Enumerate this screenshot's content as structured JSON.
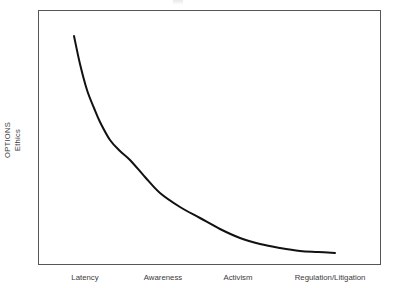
{
  "figure": {
    "background_color": "#ffffff",
    "frame_color": "#565656",
    "curve_color": "#111111",
    "text_color": "#3b3b3b"
  },
  "axes": {
    "y_label_outer": "OPTIONS",
    "y_label_inner": "Ethics",
    "x_labels": [
      {
        "text": "Latency",
        "x_px": 85
      },
      {
        "text": "Awareness",
        "x_px": 163
      },
      {
        "text": "Activism",
        "x_px": 238
      },
      {
        "text": "Regulation/Litigation",
        "x_px": 330
      }
    ]
  },
  "chart_data": {
    "type": "line",
    "title": "",
    "subtitle": "",
    "xlabel": "",
    "ylabel": "OPTIONS / Ethics",
    "ylabel_parts": [
      "OPTIONS",
      "Ethics"
    ],
    "categories": [
      "Latency",
      "Awareness",
      "Activism",
      "Regulation/Litigation"
    ],
    "x": [
      0,
      1,
      2,
      3
    ],
    "xlim": [
      -0.45,
      3.6
    ],
    "ylim": [
      0,
      1
    ],
    "grid": false,
    "legend": false,
    "legend_position": "none",
    "annotations": [],
    "series": [
      {
        "name": "Options / Ethics",
        "style": "solid",
        "color": "#111111",
        "width_px": 2,
        "description": "Monotonic exponential-decay curve: options and ethical latitude fall sharply from Latency through Awareness, then flatten toward Regulation/Litigation.",
        "points_px": [
          [
            74,
            36
          ],
          [
            80,
            64
          ],
          [
            87,
            90
          ],
          [
            94,
            108
          ],
          [
            100,
            122
          ],
          [
            110,
            140
          ],
          [
            120,
            151
          ],
          [
            130,
            160
          ],
          [
            145,
            177
          ],
          [
            160,
            193
          ],
          [
            180,
            207
          ],
          [
            200,
            218
          ],
          [
            220,
            229
          ],
          [
            240,
            238
          ],
          [
            260,
            244
          ],
          [
            280,
            248
          ],
          [
            300,
            251
          ],
          [
            318,
            252
          ],
          [
            335,
            253
          ]
        ],
        "values_normalized": [
          1.0,
          0.4,
          0.17,
          0.06
        ]
      }
    ]
  }
}
